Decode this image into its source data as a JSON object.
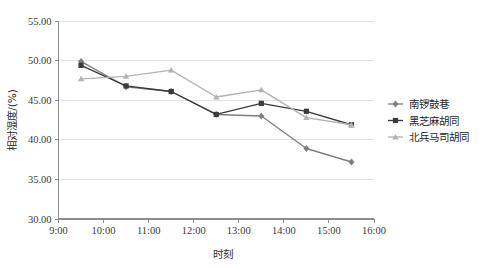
{
  "chart": {
    "type": "line",
    "background_color": "#ffffff"
  },
  "axes": {
    "x": {
      "title": "时刻",
      "ticks": [
        "9:00",
        "10:00",
        "11:00",
        "12:00",
        "13:00",
        "14:00",
        "15:00",
        "16:00"
      ],
      "min_hour": 9,
      "max_hour": 16
    },
    "y": {
      "title": "相对湿度/(%)",
      "ticks": [
        "30.00",
        "35.00",
        "40.00",
        "45.00",
        "50.00",
        "55.00"
      ],
      "min": 30,
      "max": 55
    }
  },
  "legend": {
    "position": "right",
    "entries": [
      {
        "label": "南锣鼓巷",
        "color": "#7f7f7f",
        "marker": "diamond"
      },
      {
        "label": "黑芝麻胡同",
        "color": "#3b3b3b",
        "marker": "square"
      },
      {
        "label": "北兵马司胡同",
        "color": "#b3b3b3",
        "marker": "triangle"
      }
    ]
  },
  "chart_data": {
    "type": "line",
    "title": "",
    "xlabel": "时刻",
    "ylabel": "相对湿度/(%)",
    "xlim": [
      9,
      16
    ],
    "ylim": [
      30,
      55
    ],
    "grid": true,
    "legend_position": "right",
    "x": [
      9.5,
      10.5,
      11.5,
      12.5,
      13.5,
      14.5,
      15.5
    ],
    "x_labels": [
      "9:30",
      "10:30",
      "11:30",
      "12:30",
      "13:30",
      "14:30",
      "15:30"
    ],
    "series": [
      {
        "name": "南锣鼓巷",
        "color": "#7f7f7f",
        "marker": "diamond",
        "values": [
          49.9,
          46.7,
          46.1,
          43.2,
          43.0,
          38.9,
          37.2
        ]
      },
      {
        "name": "黑芝麻胡同",
        "color": "#3b3b3b",
        "marker": "square",
        "values": [
          49.4,
          46.8,
          46.1,
          43.2,
          44.6,
          43.6,
          41.9
        ]
      },
      {
        "name": "北兵马司胡同",
        "color": "#b3b3b3",
        "marker": "triangle",
        "values": [
          47.7,
          48.0,
          48.8,
          45.4,
          46.3,
          42.8,
          41.9
        ]
      }
    ]
  }
}
